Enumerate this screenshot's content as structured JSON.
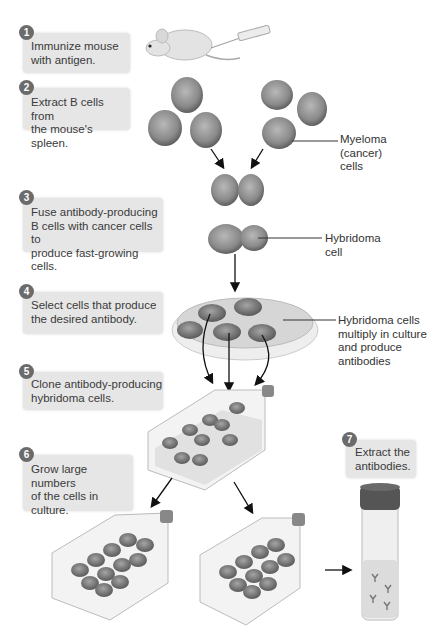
{
  "diagram": {
    "steps": [
      {
        "number": "1",
        "text": "Immunize mouse\nwith antigen."
      },
      {
        "number": "2",
        "text": "Extract B cells from\nthe mouse's spleen."
      },
      {
        "number": "3",
        "text": "Fuse antibody-producing\nB cells with cancer cells to\nproduce fast-growing cells."
      },
      {
        "number": "4",
        "text": "Select cells that produce\nthe desired antibody."
      },
      {
        "number": "5",
        "text": "Clone antibody-producing\nhybridoma cells."
      },
      {
        "number": "6",
        "text": "Grow large numbers\nof the cells in\nculture."
      },
      {
        "number": "7",
        "text": "Extract the\nantibodies."
      }
    ],
    "labels": {
      "myeloma": "Myeloma\n(cancer)\ncells",
      "hybridoma": "Hybridoma\ncell",
      "culture": "Hybridoma cells\nmultiply in culture\nand produce\nantibodies"
    },
    "colors": {
      "box": "#e6e6e6",
      "badge": "#6b6b6b",
      "cell": "#8a8a8a",
      "dish": "#d8d8d8",
      "arrow": "#111111"
    }
  }
}
